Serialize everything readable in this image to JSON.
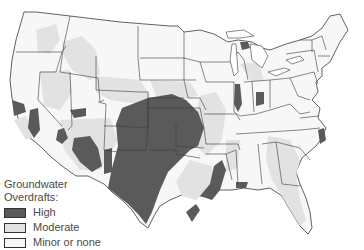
{
  "map": {
    "title": "Groundwater Overdrafts",
    "colors": {
      "high": "#5a5a5a",
      "moderate": "#e2e2e2",
      "minor": "#f7f7f7",
      "border": "#3a3a3a",
      "water": "#ffffff"
    }
  },
  "legend": {
    "title_line1": "Groundwater",
    "title_line2": "Overdrafts:",
    "items": [
      {
        "label": "High",
        "color": "#5a5a5a"
      },
      {
        "label": "Moderate",
        "color": "#e2e2e2"
      },
      {
        "label": "Minor or none",
        "color": "#f7f7f7"
      }
    ]
  }
}
